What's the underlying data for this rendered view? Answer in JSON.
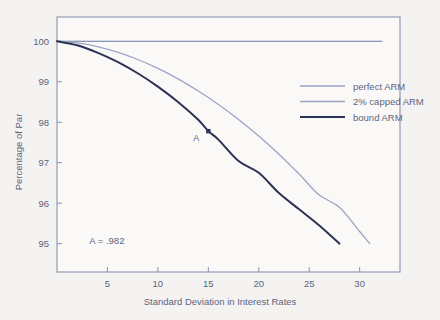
{
  "chart_data": {
    "type": "line",
    "title": "",
    "xlabel": "Standard Deviation in Interest Rates",
    "ylabel": "Percentage of Par",
    "xlim": [
      0,
      34
    ],
    "ylim": [
      94.3,
      100.6
    ],
    "xticks": [
      5,
      10,
      15,
      20,
      25,
      30
    ],
    "yticks": [
      95,
      96,
      97,
      98,
      99,
      100
    ],
    "xtick_labels": [
      "5",
      "10",
      "15",
      "20",
      "25",
      "30"
    ],
    "ytick_labels": [
      "95",
      "96",
      "97",
      "98",
      "99",
      "100"
    ],
    "grid": false,
    "legend_position": "upper right inside",
    "series": [
      {
        "name": "perfect ARM",
        "color": "#6878a8",
        "width": 1.1,
        "x": [
          0,
          4,
          8,
          12,
          16,
          20,
          24,
          28,
          31,
          32.2
        ],
        "values": [
          100,
          100,
          100,
          100,
          100,
          100,
          100,
          100,
          100,
          100
        ]
      },
      {
        "name": "2% capped ARM",
        "color": "#9aa6c2",
        "width": 1.3,
        "x": [
          0,
          2,
          4,
          6,
          8,
          10,
          12,
          14,
          16,
          18,
          20,
          22,
          24,
          26,
          28,
          30,
          31
        ],
        "values": [
          100,
          99.96,
          99.87,
          99.73,
          99.55,
          99.33,
          99.07,
          98.77,
          98.44,
          98.07,
          97.66,
          97.21,
          96.72,
          96.2,
          95.9,
          95.3,
          95.0
        ]
      },
      {
        "name": "bound ARM",
        "color": "#2b3356",
        "width": 2.0,
        "x": [
          0,
          2,
          4,
          6,
          8,
          10,
          12,
          14,
          15,
          16,
          18,
          20,
          22,
          24,
          26,
          28
        ],
        "values": [
          100,
          99.9,
          99.72,
          99.49,
          99.21,
          98.88,
          98.5,
          98.06,
          97.78,
          97.57,
          97.04,
          96.75,
          96.25,
          95.85,
          95.45,
          95.0
        ]
      }
    ],
    "annotations": [
      {
        "name": "point-a",
        "label": "A",
        "x": 15,
        "y": 97.78,
        "marker": "square",
        "color": "#2b3356"
      },
      {
        "name": "a-value-note",
        "text": "A = .982",
        "x": 3.2,
        "y": 95.0
      }
    ],
    "legend_entries": [
      {
        "label": "perfect ARM",
        "color": "#6878a8",
        "width": 1.1
      },
      {
        "label": "2% capped ARM",
        "color": "#9aa6c2",
        "width": 1.3
      },
      {
        "label": "bound ARM",
        "color": "#2b3356",
        "width": 2.0
      }
    ],
    "colors": {
      "background": "#f4f3f1",
      "plot_background": "#faf9f7",
      "frame": "#8a93ad",
      "text": "#5a6480"
    }
  }
}
